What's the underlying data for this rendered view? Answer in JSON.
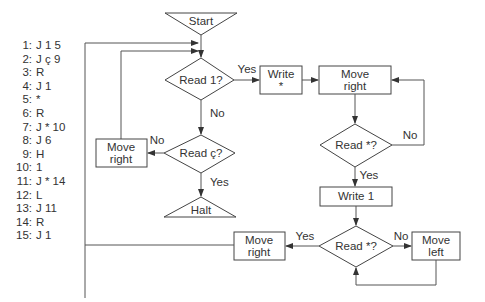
{
  "program": [
    {
      "n": "1:",
      "instr": "J 1 5"
    },
    {
      "n": "2:",
      "instr": "J ç 9"
    },
    {
      "n": "3:",
      "instr": "R"
    },
    {
      "n": "4:",
      "instr": "J 1"
    },
    {
      "n": "5:",
      "instr": "*"
    },
    {
      "n": "6:",
      "instr": "R"
    },
    {
      "n": "7:",
      "instr": "J * 10"
    },
    {
      "n": "8:",
      "instr": "J 6"
    },
    {
      "n": "9:",
      "instr": "H"
    },
    {
      "n": "10:",
      "instr": "1"
    },
    {
      "n": "11:",
      "instr": "J * 14"
    },
    {
      "n": "12:",
      "instr": "L"
    },
    {
      "n": "13:",
      "instr": "J 11"
    },
    {
      "n": "14:",
      "instr": "R"
    },
    {
      "n": "15:",
      "instr": "J 1"
    }
  ],
  "flowchart": {
    "start": "Start",
    "read1": "Read 1?",
    "write_star_1": "Write",
    "write_star_2": "*",
    "move_right_top_1": "Move",
    "move_right_top_2": "right",
    "read_star_top": "Read *?",
    "write1": "Write 1",
    "read_star_bottom": "Read *?",
    "move_right_bottom_1": "Move",
    "move_right_bottom_2": "right",
    "move_left_1": "Move",
    "move_left_2": "left",
    "read_c": "Read ç?",
    "move_right_left_1": "Move",
    "move_right_left_2": "right",
    "halt": "Halt",
    "labels": {
      "yes": "Yes",
      "no": "No"
    }
  }
}
